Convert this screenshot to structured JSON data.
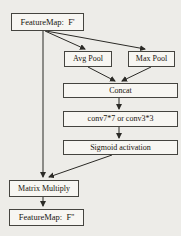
{
  "diagram": {
    "colors": {
      "background": "#edece8",
      "box_fill": "#f7f6f2",
      "box_border": "#45443f",
      "arrow": "#2b2a26",
      "text": "#17150f"
    },
    "nodes": {
      "featuremap_in": "FeatureMap:  F'",
      "avg_pool": "Avg Pool",
      "max_pool": "Max Pool",
      "concat": "Concat",
      "conv": "conv7*7 or conv3*3",
      "sigmoid": "Sigmoid activation",
      "matrix_multiply": "Matrix Multiply",
      "featuremap_out": "FeatureMap:  F''"
    }
  }
}
